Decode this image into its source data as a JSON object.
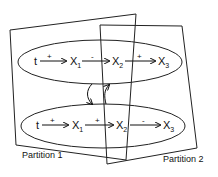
{
  "diagram": {
    "partitions": [
      {
        "label": "Partition 1"
      },
      {
        "label": "Partition 2"
      }
    ],
    "loops": [
      {
        "name": "upper",
        "nodes": [
          "t",
          "X",
          "X",
          "X"
        ],
        "subscripts": [
          "",
          "1",
          "2",
          "3"
        ],
        "edges": [
          {
            "from": "t",
            "to": "X1",
            "sign": "+"
          },
          {
            "from": "X1",
            "to": "X2",
            "sign": "-"
          },
          {
            "from": "X2",
            "to": "X3",
            "sign": "+"
          }
        ]
      },
      {
        "name": "lower",
        "nodes": [
          "t",
          "X",
          "X",
          "X"
        ],
        "subscripts": [
          "",
          "1",
          "2",
          "3"
        ],
        "edges": [
          {
            "from": "t",
            "to": "X1",
            "sign": "+"
          },
          {
            "from": "X1",
            "to": "X2",
            "sign": "+"
          },
          {
            "from": "X2",
            "to": "X3",
            "sign": "-"
          }
        ]
      }
    ]
  }
}
